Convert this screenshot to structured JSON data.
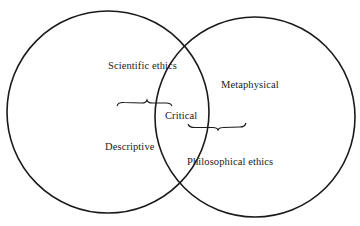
{
  "diagram": {
    "type": "venn",
    "colors": {
      "stroke": "#1a1a1a",
      "background": "#ffffff",
      "text": "#1a1a1a"
    },
    "circles": [
      {
        "id": "left",
        "cx": 108,
        "cy": 112,
        "r": 101
      },
      {
        "id": "right",
        "cx": 255,
        "cy": 117,
        "r": 100
      }
    ],
    "labels": {
      "scientific_ethics": "Scientific ethics",
      "metaphysical": "Metaphysical",
      "critical": "Critical",
      "descriptive": "Descriptive",
      "philosophical_ethics": "Philosophical ethics"
    },
    "braces": [
      {
        "id": "left-brace",
        "x1": 117,
        "x2": 172,
        "y": 103,
        "notch": 147,
        "direction": "up"
      },
      {
        "id": "right-brace",
        "x1": 188,
        "x2": 246,
        "y": 127,
        "notch": 218,
        "direction": "down"
      }
    ]
  }
}
